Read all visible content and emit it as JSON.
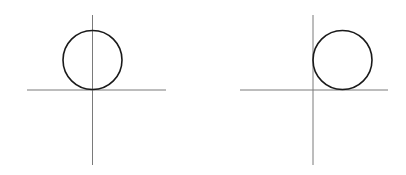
{
  "colors": {
    "background": "#ffffff",
    "axis": "#7a7a7a",
    "circle": "#1a1a1a"
  },
  "figures": [
    {
      "name": "circle-tangent-at-origin",
      "axes": {
        "origin": [
          92.5,
          90
        ],
        "x_range": [
          27,
          166
        ],
        "y_range": [
          15,
          165
        ]
      },
      "circle": {
        "cx": 92.5,
        "cy": 60,
        "r": 29.5
      }
    },
    {
      "name": "circle-tangent-to-both-axes",
      "axes": {
        "origin": [
          313,
          90
        ],
        "x_range": [
          240,
          388
        ],
        "y_range": [
          15,
          165
        ]
      },
      "circle": {
        "cx": 342.5,
        "cy": 60,
        "r": 29.5
      }
    }
  ]
}
